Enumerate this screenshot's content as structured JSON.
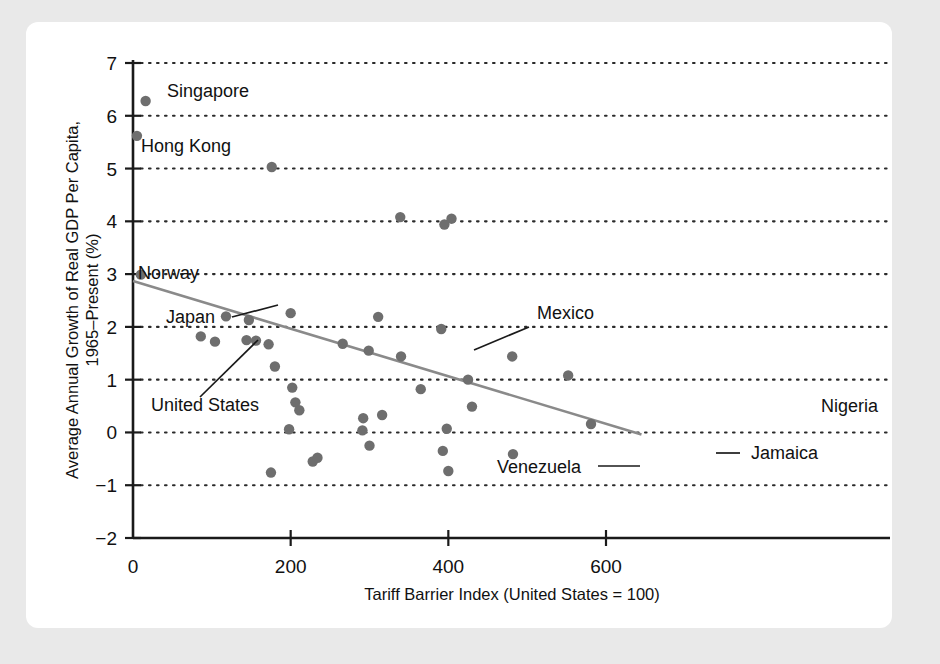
{
  "figure": {
    "background_color": "#e9e9e9",
    "panel_color": "#ffffff",
    "dot_color": "#6e6e6e",
    "trend_color": "#8a8a8a",
    "grid_color": "#2b2b2b"
  },
  "chart_data": {
    "type": "scatter",
    "title": "",
    "xlabel": "Tariff Barrier Index (United States = 100)",
    "ylabel": "Average Annual Growth of Real GDP Per Capita, 1965–Present (%)",
    "xlim": [
      0,
      650
    ],
    "ylim": [
      -2,
      7
    ],
    "xticks": [
      0,
      200,
      400,
      600
    ],
    "xtick_labels": [
      "0",
      "200",
      "400",
      "600"
    ],
    "yticks": [
      -2,
      -1,
      0,
      1,
      2,
      3,
      4,
      5,
      6,
      7
    ],
    "ytick_labels": [
      "−2",
      "−1",
      "0",
      "1",
      "2",
      "3",
      "4",
      "5",
      "6",
      "7"
    ],
    "grid": "horizontal-dotted",
    "legend": "none",
    "points": [
      {
        "x": 5,
        "y": 5.62,
        "label": "Hong Kong"
      },
      {
        "x": 16,
        "y": 6.28,
        "label": "Singapore"
      },
      {
        "x": 10,
        "y": 2.99,
        "label": "Norway"
      },
      {
        "x": 104,
        "y": 1.72,
        "label": "United States"
      },
      {
        "x": 118,
        "y": 2.2,
        "label": "Japan"
      },
      {
        "x": 299,
        "y": 1.55,
        "label": "Mexico"
      },
      {
        "x": 400,
        "y": -0.73,
        "label": "Venezuela"
      },
      {
        "x": 482,
        "y": -0.41,
        "label": "Jamaica"
      },
      {
        "x": 581,
        "y": 0.16,
        "label": "Nigeria"
      },
      {
        "x": 176,
        "y": 5.03,
        "label": ""
      },
      {
        "x": 339,
        "y": 4.08,
        "label": ""
      },
      {
        "x": 395,
        "y": 3.94,
        "label": ""
      },
      {
        "x": 404,
        "y": 4.05,
        "label": ""
      },
      {
        "x": 86,
        "y": 1.82,
        "label": ""
      },
      {
        "x": 147,
        "y": 2.13,
        "label": ""
      },
      {
        "x": 144,
        "y": 1.75,
        "label": ""
      },
      {
        "x": 156,
        "y": 1.74,
        "label": ""
      },
      {
        "x": 172,
        "y": 1.67,
        "label": ""
      },
      {
        "x": 180,
        "y": 1.25,
        "label": ""
      },
      {
        "x": 175,
        "y": -0.76,
        "label": ""
      },
      {
        "x": 200,
        "y": 2.26,
        "label": ""
      },
      {
        "x": 202,
        "y": 0.85,
        "label": ""
      },
      {
        "x": 206,
        "y": 0.57,
        "label": ""
      },
      {
        "x": 211,
        "y": 0.42,
        "label": ""
      },
      {
        "x": 198,
        "y": 0.06,
        "label": ""
      },
      {
        "x": 228,
        "y": -0.55,
        "label": ""
      },
      {
        "x": 234,
        "y": -0.48,
        "label": ""
      },
      {
        "x": 266,
        "y": 1.68,
        "label": ""
      },
      {
        "x": 292,
        "y": 0.27,
        "label": ""
      },
      {
        "x": 291,
        "y": 0.04,
        "label": ""
      },
      {
        "x": 300,
        "y": -0.25,
        "label": ""
      },
      {
        "x": 311,
        "y": 2.19,
        "label": ""
      },
      {
        "x": 316,
        "y": 0.33,
        "label": ""
      },
      {
        "x": 340,
        "y": 1.44,
        "label": ""
      },
      {
        "x": 365,
        "y": 0.82,
        "label": ""
      },
      {
        "x": 391,
        "y": 1.96,
        "label": ""
      },
      {
        "x": 393,
        "y": -0.35,
        "label": ""
      },
      {
        "x": 398,
        "y": 0.07,
        "label": ""
      },
      {
        "x": 425,
        "y": 1.0,
        "label": ""
      },
      {
        "x": 430,
        "y": 0.49,
        "label": ""
      },
      {
        "x": 481,
        "y": 1.44,
        "label": ""
      },
      {
        "x": 552,
        "y": 1.08,
        "label": ""
      }
    ],
    "trend_line": {
      "x_start": 0,
      "y_start": 2.87,
      "x_end": 645,
      "y_end": -0.04
    },
    "annotations": [
      {
        "text": "Singapore",
        "target_x": 16,
        "target_y": 6.28,
        "style": "adjacent-right"
      },
      {
        "text": "Hong Kong",
        "target_x": 5,
        "target_y": 5.62,
        "style": "adjacent-below-right"
      },
      {
        "text": "Norway",
        "target_x": 10,
        "target_y": 2.99,
        "style": "adjacent-above-right"
      },
      {
        "text": "Japan",
        "target_x": 118,
        "target_y": 2.2,
        "style": "leader-line-right"
      },
      {
        "text": "United States",
        "target_x": 104,
        "target_y": 1.72,
        "style": "leader-line-up"
      },
      {
        "text": "Mexico",
        "target_x": 299,
        "target_y": 1.55,
        "style": "leader-line-down-left"
      },
      {
        "text": "Venezuela",
        "target_x": 400,
        "target_y": -0.73,
        "style": "leader-line-right"
      },
      {
        "text": "Jamaica",
        "target_x": 482,
        "target_y": -0.41,
        "style": "leader-line-left"
      },
      {
        "text": "Nigeria",
        "target_x": 581,
        "target_y": 0.16,
        "style": "adjacent-above-right"
      }
    ]
  }
}
